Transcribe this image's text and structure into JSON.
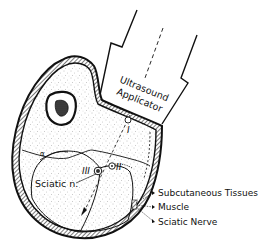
{
  "figure": {
    "type": "anatomical cross-section diagram",
    "applicator_label_line1": "Ultrasound",
    "applicator_label_line2": "Applicator",
    "region_label_sciatic": "Sciatic n.",
    "marker_I": "I",
    "marker_II": "II",
    "marker_III": "III",
    "marker_alpha": "α",
    "legend": [
      {
        "label": "Subcutaneous Tissues"
      },
      {
        "label": "Muscle"
      },
      {
        "label": "Sciatic Nerve"
      }
    ],
    "colors": {
      "ink": "#111111",
      "background": "#ffffff",
      "stipple": "#9a9a9a"
    }
  }
}
